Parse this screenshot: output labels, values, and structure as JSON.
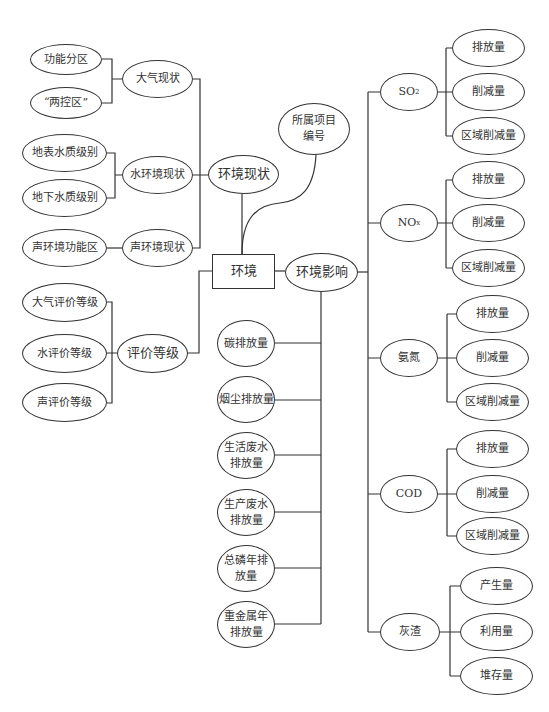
{
  "diagram": {
    "root": "环境",
    "branches": {
      "status": {
        "label": "环境现状",
        "children": [
          {
            "label": "大气现状",
            "children": [
              "功能分区",
              "“两控区”"
            ]
          },
          {
            "label": "水环境现状",
            "children": [
              "地表水质级别",
              "地下水质级别"
            ]
          },
          {
            "label": "声环境现状",
            "children": [
              "声环境功能区"
            ]
          }
        ]
      },
      "project": {
        "label_line1": "所属项目",
        "label_line2": "编号"
      },
      "grade": {
        "label": "评价等级",
        "children": [
          "大气评价等级",
          "水评价等级",
          "声评价等级"
        ]
      },
      "impact": {
        "label": "环境影响",
        "direct": [
          {
            "line1": "碳排放量",
            "line2": ""
          },
          {
            "line1": "烟尘排放量",
            "line2": ""
          },
          {
            "line1": "生活废水",
            "line2": "排放量"
          },
          {
            "line1": "生产废水",
            "line2": "排放量"
          },
          {
            "line1": "总磷年排",
            "line2": "放量"
          },
          {
            "line1": "重金属年",
            "line2": "排放量"
          }
        ],
        "pollutants": [
          {
            "label": "SO",
            "sub": "2",
            "children": [
              "排放量",
              "削减量",
              "区域削减量"
            ]
          },
          {
            "label": "NO",
            "sub": "x",
            "children": [
              "排放量",
              "削减量",
              "区域削减量"
            ]
          },
          {
            "label": "氨氮",
            "sub": "",
            "children": [
              "排放量",
              "削减量",
              "区域削减量"
            ]
          },
          {
            "label": "COD",
            "sub": "",
            "children": [
              "排放量",
              "削减量",
              "区域削减量"
            ]
          },
          {
            "label": "灰渣",
            "sub": "",
            "children": [
              "产生量",
              "利用量",
              "堆存量"
            ]
          }
        ]
      }
    }
  }
}
